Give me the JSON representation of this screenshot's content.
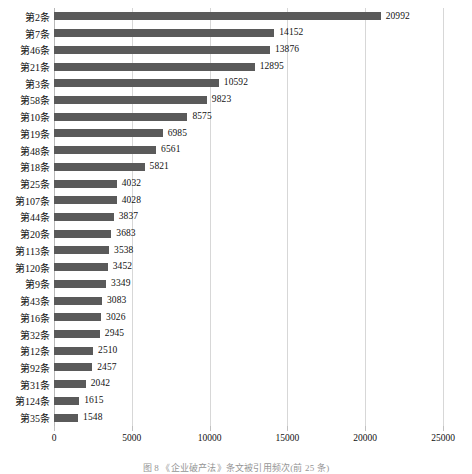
{
  "chart_data": {
    "type": "bar",
    "orientation": "horizontal",
    "title": "",
    "subtitle": "",
    "xlabel": "",
    "ylabel": "",
    "xlim": [
      0,
      25000
    ],
    "xticks": [
      "0",
      "5000",
      "10000",
      "15000",
      "20000",
      "25000"
    ],
    "xtick_values": [
      0,
      5000,
      10000,
      15000,
      20000,
      25000
    ],
    "grid": "vertical",
    "legend": "none",
    "bar_color": "#5a5a5a",
    "categories": [
      "第2条",
      "第7条",
      "第46条",
      "第21条",
      "第3条",
      "第58条",
      "第10条",
      "第19条",
      "第48条",
      "第18条",
      "第25条",
      "第107条",
      "第44条",
      "第20条",
      "第113条",
      "第120条",
      "第9条",
      "第43条",
      "第16条",
      "第32条",
      "第12条",
      "第92条",
      "第31条",
      "第124条",
      "第35条"
    ],
    "values": [
      20992,
      14152,
      13876,
      12895,
      10592,
      9823,
      8575,
      6985,
      6561,
      5821,
      4032,
      4028,
      3837,
      3683,
      3538,
      3452,
      3349,
      3083,
      3026,
      2945,
      2510,
      2457,
      2042,
      1615,
      1548
    ],
    "data_labels": [
      "20992",
      "14152",
      "13876",
      "12895",
      "10592",
      "9823",
      "8575",
      "6985",
      "6561",
      "5821",
      "4032",
      "4028",
      "3837",
      "3683",
      "3538",
      "3452",
      "3349",
      "3083",
      "3026",
      "2945",
      "2510",
      "2457",
      "2042",
      "1615",
      "1548"
    ]
  },
  "caption": {
    "text": "图 8  《企业破产法》条文被引用频次(前 25 条)"
  }
}
